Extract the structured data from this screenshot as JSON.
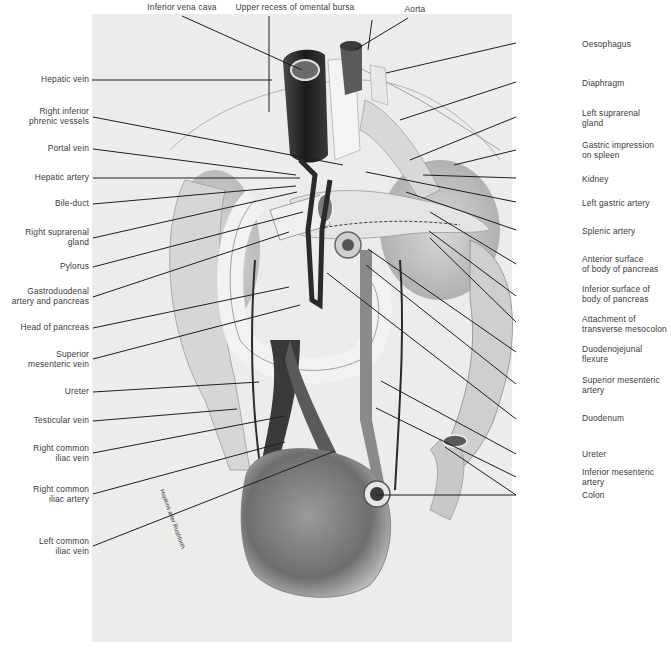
{
  "figure": {
    "type": "anatomical illustration",
    "artist_signature": "Hopkins after Rushforth (handwritten)"
  },
  "labels": {
    "top": [
      {
        "id": "inferior-vena-cava",
        "text": "Inferior vena cava"
      },
      {
        "id": "upper-recess-omental-bursa",
        "text": "Upper recess of omental bursa"
      },
      {
        "id": "aorta",
        "text": "Aorta"
      }
    ],
    "left": [
      {
        "id": "hepatic-vein",
        "text": "Hepatic vein"
      },
      {
        "id": "right-inferior-phrenic-vessels",
        "text": "Right inferior\nphrenic vessels"
      },
      {
        "id": "portal-vein",
        "text": "Portal vein"
      },
      {
        "id": "hepatic-artery",
        "text": "Hepatic artery"
      },
      {
        "id": "bile-duct",
        "text": "Bile-duct"
      },
      {
        "id": "right-suprarenal-gland",
        "text": "Right suprarenal\ngland"
      },
      {
        "id": "pylorus",
        "text": "Pylorus"
      },
      {
        "id": "gastroduodenal-artery-pancreas",
        "text": "Gastroduodenal\nartery and pancreas"
      },
      {
        "id": "head-of-pancreas",
        "text": "Head of pancreas"
      },
      {
        "id": "superior-mesenteric-vein",
        "text": "Superior\nmesenteric vein"
      },
      {
        "id": "ureter-right",
        "text": "Ureter"
      },
      {
        "id": "testicular-vein",
        "text": "Testicular vein"
      },
      {
        "id": "right-common-iliac-vein",
        "text": "Right common\niliac vein"
      },
      {
        "id": "right-common-iliac-artery",
        "text": "Right common\niliac artery"
      },
      {
        "id": "left-common-iliac-vein",
        "text": "Left common\niliac vein"
      }
    ],
    "right": [
      {
        "id": "oesophagus",
        "text": "Oesophagus"
      },
      {
        "id": "diaphragm",
        "text": "Diaphragm"
      },
      {
        "id": "left-suprarenal-gland",
        "text": "Left suprarenal\ngland"
      },
      {
        "id": "gastric-impression-spleen",
        "text": "Gastric impression\non spleen"
      },
      {
        "id": "kidney",
        "text": "Kidney"
      },
      {
        "id": "left-gastric-artery",
        "text": "Left gastric artery"
      },
      {
        "id": "splenic-artery",
        "text": "Splenic artery"
      },
      {
        "id": "anterior-surface-body-pancreas",
        "text": "Anterior surface\nof body of pancreas"
      },
      {
        "id": "inferior-surface-body-pancreas",
        "text": "Inferior surface of\nbody of pancreas"
      },
      {
        "id": "attachment-transverse-mesocolon",
        "text": "Attachment of\ntransverse mesocolon"
      },
      {
        "id": "duodenojejunal-flexure",
        "text": "Duodenojejunal\nflexure"
      },
      {
        "id": "superior-mesenteric-artery",
        "text": "Superior mesenteric\nartery"
      },
      {
        "id": "duodenum",
        "text": "Duodenum"
      },
      {
        "id": "ureter-left",
        "text": "Ureter"
      },
      {
        "id": "inferior-mesenteric-artery",
        "text": "Inferior mesenteric\nartery"
      },
      {
        "id": "colon",
        "text": "Colon"
      }
    ]
  },
  "colors": {
    "background": "#ffffff",
    "plate": "#ececea",
    "leader_line": "#1e1e1e",
    "label_text": "#3a3a3a",
    "dark_vessel": "#2a2a2a",
    "mid_tone": "#8a8a8a",
    "light_tone": "#d8d8d6"
  }
}
